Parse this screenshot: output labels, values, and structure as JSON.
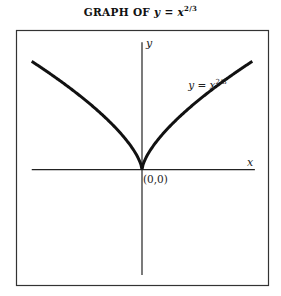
{
  "chart_data": {
    "type": "line",
    "title_parts": {
      "prefix": "GRAPH  OF ",
      "lhs": "y",
      "eq": " = ",
      "base": "x",
      "exponent": "2/3"
    },
    "function": "y = x^(2/3)",
    "xlabel": "x",
    "ylabel": "y",
    "origin_label": "(0,0)",
    "curve_label": {
      "lhs": "y",
      "eq": " = ",
      "base": "x",
      "exponent": "2/3"
    },
    "x_range": [
      -2.1,
      2.1
    ],
    "xlim": [
      -2.4,
      2.4
    ],
    "ylim": [
      -1.75,
      2.1
    ],
    "grid": false,
    "legend": "none",
    "series": [
      {
        "name": "y = x^(2/3)",
        "x_min": -2.1,
        "x_max": 2.1,
        "color": "#111111"
      }
    ]
  }
}
